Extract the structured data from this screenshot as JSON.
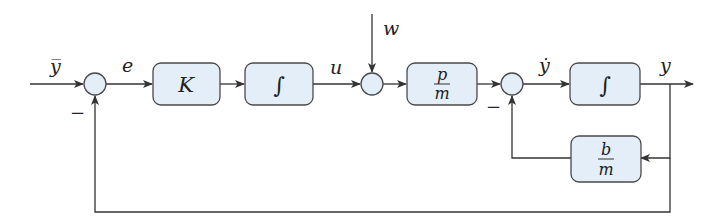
{
  "diagram": {
    "type": "block-diagram",
    "colors": {
      "block_fill": "#e4eef8",
      "stroke": "#4a4a4a",
      "text": "#222222",
      "background": "#ffffff"
    },
    "signals": {
      "reference": "y̅",
      "error": "e",
      "control": "u",
      "disturbance": "w",
      "velocity": "ẏ",
      "output": "y"
    },
    "blocks": {
      "gain": {
        "label": "K"
      },
      "integrator1": {
        "label": "∫"
      },
      "plant_gain": {
        "numerator": "p",
        "denominator": "m"
      },
      "integrator2": {
        "label": "∫"
      },
      "damping": {
        "numerator": "b",
        "denominator": "m"
      }
    },
    "signs": {
      "sum1_feedback": "−",
      "sum3_feedback": "−"
    }
  }
}
